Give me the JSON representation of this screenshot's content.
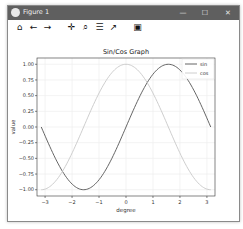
{
  "window": {
    "title": "Figure 1",
    "minimize_label": "—",
    "maximize_label": "☐",
    "close_label": "✕"
  },
  "toolbar": {
    "home": "⌂",
    "back": "←",
    "forward": "→",
    "pan": "✛",
    "zoom": "⌕",
    "configure": "☰",
    "edit": "↗",
    "save": "▣"
  },
  "colors": {
    "titlebar": "#5f5f5f",
    "sin_line": "#555555",
    "cos_line": "#c8c8c8",
    "grid": "#eeeeee"
  },
  "chart_data": {
    "type": "line",
    "title": "Sin/Cos Graph",
    "xlabel": "degree",
    "ylabel": "value",
    "xlim": [
      -3.3,
      3.3
    ],
    "ylim": [
      -1.1,
      1.1
    ],
    "xticks": [
      "-3",
      "-2",
      "-1",
      "0",
      "1",
      "2",
      "3"
    ],
    "yticks": [
      "1.00",
      "0.75",
      "0.50",
      "0.25",
      "0.00",
      "-0.25",
      "-0.50",
      "-0.75",
      "-1.00"
    ],
    "grid": true,
    "legend_position": "upper right",
    "x_domain": [
      -3.14159,
      3.14159
    ],
    "series": [
      {
        "name": "sin",
        "function": "sin(x)",
        "color": "#555555"
      },
      {
        "name": "cos",
        "function": "cos(x)",
        "color": "#c8c8c8"
      }
    ]
  }
}
